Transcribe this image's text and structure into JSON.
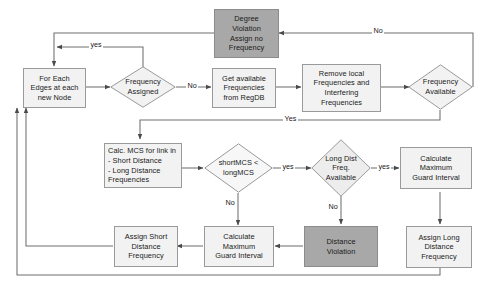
{
  "diagram": {
    "colors": {
      "shaded_fill": "#a8a8a8",
      "box_fill": "#f2f2f2",
      "border": "#9a9a9a",
      "line": "#6f6f6f",
      "text": "#1a1a1a",
      "background": "#ffffff"
    },
    "nodes": [
      {
        "id": "for_each_edges",
        "shape": "box",
        "style": "light",
        "label": "For Each\nEdges at each\nnew Node"
      },
      {
        "id": "frequency_assigned",
        "shape": "diamond",
        "style": "light",
        "label": "Frequency\nAssigned"
      },
      {
        "id": "degree_violation",
        "shape": "box",
        "style": "shaded",
        "label": "Degree\nViolation\nAssign no\nFrequency"
      },
      {
        "id": "get_available_freq",
        "shape": "box",
        "style": "light",
        "label": "Get available\nFrequencies\nfrom RegDB"
      },
      {
        "id": "remove_local_freq",
        "shape": "box",
        "style": "light",
        "label": "Remove local\nFrequencies and\nInterfering\nFrequencies"
      },
      {
        "id": "frequency_available",
        "shape": "diamond",
        "style": "light",
        "label": "Frequency\nAvailable"
      },
      {
        "id": "calc_mcs",
        "shape": "box",
        "style": "light",
        "align": "left",
        "label": "Calc. MCS for link in\n   - Short Distance\n   - Long Distance\nFrequencies"
      },
      {
        "id": "short_vs_long_mcs",
        "shape": "diamond",
        "style": "light",
        "label": "shortMCS <\nlongMCS"
      },
      {
        "id": "long_dist_freq_available",
        "shape": "diamond",
        "style": "light",
        "label": "Long Dist\nFreq.\nAvailable"
      },
      {
        "id": "calculate_max_guard_interval_right",
        "shape": "box",
        "style": "light",
        "label": "Calculate\nMaximum\nGuard Interval"
      },
      {
        "id": "assign_long_distance_freq",
        "shape": "box",
        "style": "light",
        "label": "Assign Long\nDistance\nFrequency"
      },
      {
        "id": "distance_violation",
        "shape": "box",
        "style": "shaded",
        "label": "Distance\nViolation"
      },
      {
        "id": "calculate_max_guard_interval_left",
        "shape": "box",
        "style": "light",
        "label": "Calculate\nMaximum\nGuard Interval"
      },
      {
        "id": "assign_short_distance_freq",
        "shape": "box",
        "style": "light",
        "label": "Assign Short\nDistance\nFrequency"
      }
    ],
    "edge_labels": [
      {
        "id": "yes_freq_assigned_loop",
        "text": "yes"
      },
      {
        "id": "no_freq_assigned",
        "text": "No"
      },
      {
        "id": "no_freq_available",
        "text": "No"
      },
      {
        "id": "yes_freq_available",
        "text": "Yes"
      },
      {
        "id": "yes_short_lt_long",
        "text": "yes"
      },
      {
        "id": "no_short_lt_long",
        "text": "No"
      },
      {
        "id": "yes_long_dist_available",
        "text": "yes"
      },
      {
        "id": "no_long_dist_available",
        "text": "No"
      }
    ]
  }
}
